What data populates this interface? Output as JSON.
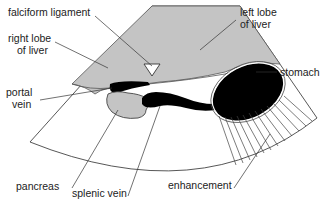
{
  "colors": {
    "liver": "#c4c4c4",
    "pancreas": "#c4c4c4",
    "vessel": "#000000",
    "stomach": "#000000",
    "outline": "#444444",
    "background": "#ffffff"
  },
  "labels": {
    "falciform": "falciform ligament",
    "right_lobe_1": "right lobe",
    "right_lobe_2": "of liver",
    "left_lobe_1": "left lobe",
    "left_lobe_2": "of liver",
    "portal_1": "portal",
    "portal_2": "vein",
    "stomach": "stomach",
    "pancreas": "pancreas",
    "splenic": "splenic vein",
    "enhancement": "enhancement"
  }
}
